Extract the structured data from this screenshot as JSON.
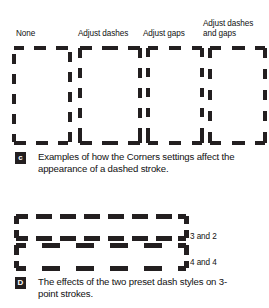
{
  "figure": {
    "background_color": "#ffffff",
    "ink_color": "#231f20"
  },
  "corners_examples": {
    "column_labels": [
      {
        "id": "none",
        "text": "None"
      },
      {
        "id": "adjust-dashes",
        "text": "Adjust dashes"
      },
      {
        "id": "adjust-gaps",
        "text": "Adjust gaps"
      },
      {
        "id": "adjust-dashes-and-gaps",
        "text": "Adjust dashes\nand gaps"
      }
    ]
  },
  "caption_c": {
    "badge": "c",
    "text": "Examples of how the Corners settings affect the appearance of a dashed stroke."
  },
  "preset_dashes": {
    "labels": [
      {
        "id": "three-and-two",
        "text": "3 and 2"
      },
      {
        "id": "four-and-four",
        "text": "4 and 4"
      }
    ]
  },
  "caption_d": {
    "badge": "D",
    "text": "The effects of the two preset dash styles on 3-point strokes."
  }
}
